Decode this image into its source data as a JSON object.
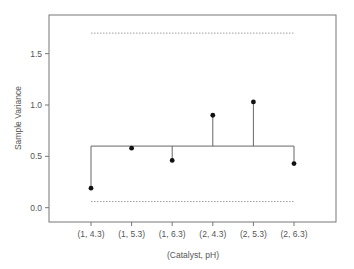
{
  "chart_data": {
    "type": "scatter",
    "subtype": "variance control chart (S² chart) with center line and control limits",
    "title": "",
    "xlabel": "(Catalyst, pH)",
    "ylabel": "Sample Variance",
    "categories": [
      "(1, 4.3)",
      "(1, 5.3)",
      "(1, 6.3)",
      "(2, 4.3)",
      "(2, 5.3)",
      "(2, 6.3)"
    ],
    "values": [
      0.19,
      0.58,
      0.46,
      0.9,
      1.03,
      0.43
    ],
    "center_line": 0.6,
    "upper_limit": 1.7,
    "lower_limit": 0.06,
    "yticks": [
      0.0,
      0.5,
      1.0,
      1.5
    ],
    "ytick_labels": [
      "0.0",
      "0.5",
      "1.0",
      "1.5"
    ],
    "ylim": [
      -0.14,
      1.87
    ],
    "grid": false,
    "legend": null
  },
  "colors": {
    "axis": "#777777",
    "points": "#111111",
    "center_line": "#666666",
    "limit_lines": "#888888",
    "text": "#555555"
  }
}
